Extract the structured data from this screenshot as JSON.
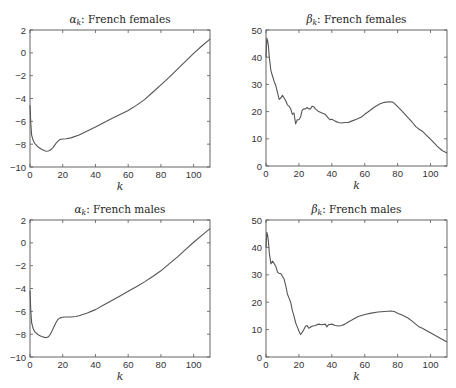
{
  "chart_data": [
    {
      "id": "alpha_females",
      "type": "line",
      "title": "α_k: French females",
      "title_symbol": "α",
      "title_subscript": "k",
      "title_text": ": French females",
      "xlabel": "k",
      "ylabel": "",
      "xlim": [
        0,
        110
      ],
      "ylim": [
        -10,
        2
      ],
      "xticks": [
        0,
        20,
        40,
        60,
        80,
        100
      ],
      "yticks": [
        -10,
        -8,
        -6,
        -4,
        -2,
        0,
        2
      ],
      "grid": false,
      "series": [
        {
          "name": "alpha_k",
          "x": [
            0,
            0.5,
            1,
            2,
            3,
            5,
            7,
            9,
            10,
            11,
            12,
            13,
            14,
            15,
            16,
            17,
            18,
            19,
            20,
            22,
            25,
            30,
            35,
            40,
            45,
            50,
            55,
            60,
            65,
            70,
            75,
            80,
            85,
            90,
            95,
            100,
            105,
            110
          ],
          "values": [
            -4.6,
            -6.2,
            -7.2,
            -7.7,
            -7.95,
            -8.25,
            -8.45,
            -8.58,
            -8.62,
            -8.6,
            -8.55,
            -8.45,
            -8.3,
            -8.1,
            -7.9,
            -7.75,
            -7.62,
            -7.57,
            -7.55,
            -7.52,
            -7.45,
            -7.2,
            -6.85,
            -6.5,
            -6.12,
            -5.75,
            -5.4,
            -5.05,
            -4.6,
            -4.1,
            -3.45,
            -2.8,
            -2.15,
            -1.45,
            -0.75,
            -0.05,
            0.6,
            1.2
          ]
        }
      ]
    },
    {
      "id": "beta_females",
      "type": "line",
      "title": "β_k: French females",
      "title_symbol": "β",
      "title_subscript": "k",
      "title_text": ": French females",
      "xlabel": "k",
      "ylabel": "",
      "xlim": [
        0,
        110
      ],
      "ylim": [
        0,
        50
      ],
      "xticks": [
        0,
        20,
        40,
        60,
        80,
        100
      ],
      "yticks": [
        0,
        10,
        20,
        30,
        40,
        50
      ],
      "grid": false,
      "series": [
        {
          "name": "beta_k",
          "x": [
            0,
            0.5,
            1,
            1.5,
            2,
            3,
            4,
            5,
            6,
            7,
            8,
            9,
            10,
            11,
            12,
            13,
            14,
            15,
            16,
            17,
            18,
            19,
            20,
            21,
            22,
            23,
            24,
            25,
            26,
            27,
            28,
            29,
            30,
            32,
            34,
            36,
            38,
            39,
            40,
            42,
            44,
            46,
            48,
            50,
            52,
            55,
            58,
            60,
            63,
            66,
            69,
            72,
            75,
            77,
            78,
            80,
            83,
            86,
            89,
            91,
            92,
            93,
            95,
            98,
            101,
            104,
            107,
            110
          ],
          "values": [
            40,
            47,
            46,
            44,
            40,
            35,
            33,
            31,
            29.5,
            27,
            24.5,
            25,
            26,
            25,
            24,
            22.5,
            22,
            21,
            19,
            19.5,
            15.5,
            17,
            17,
            18,
            20.5,
            21,
            21,
            21.5,
            21,
            21,
            22,
            21.8,
            21,
            20,
            19.5,
            19,
            17.5,
            17,
            17.2,
            16.5,
            16,
            15.8,
            16,
            16,
            16.5,
            17.2,
            18,
            19,
            20.3,
            21.7,
            22.8,
            23.4,
            23.6,
            23.5,
            23,
            21.8,
            20,
            18,
            16,
            14.5,
            14,
            13.5,
            12.8,
            11,
            9.2,
            7.3,
            5.7,
            4.8
          ]
        }
      ]
    },
    {
      "id": "alpha_males",
      "type": "line",
      "title": "α_k: French males",
      "title_symbol": "α",
      "title_subscript": "k",
      "title_text": ": French males",
      "xlabel": "k",
      "ylabel": "",
      "xlim": [
        0,
        110
      ],
      "ylim": [
        -10,
        2
      ],
      "xticks": [
        0,
        20,
        40,
        60,
        80,
        100
      ],
      "yticks": [
        -10,
        -8,
        -6,
        -4,
        -2,
        0,
        2
      ],
      "grid": false,
      "series": [
        {
          "name": "alpha_k",
          "x": [
            0,
            0.5,
            1,
            2,
            3,
            5,
            7,
            9,
            10,
            11,
            12,
            13,
            14,
            15,
            16,
            17,
            18,
            19,
            20,
            22,
            25,
            28,
            30,
            35,
            40,
            45,
            50,
            55,
            60,
            65,
            70,
            75,
            80,
            85,
            90,
            95,
            100,
            105,
            110
          ],
          "values": [
            -4.2,
            -6.0,
            -7.0,
            -7.55,
            -7.8,
            -8.05,
            -8.2,
            -8.28,
            -8.3,
            -8.25,
            -8.1,
            -7.85,
            -7.55,
            -7.25,
            -6.95,
            -6.72,
            -6.6,
            -6.55,
            -6.52,
            -6.5,
            -6.5,
            -6.45,
            -6.38,
            -6.15,
            -5.85,
            -5.45,
            -5.05,
            -4.65,
            -4.25,
            -3.85,
            -3.42,
            -2.95,
            -2.45,
            -1.85,
            -1.25,
            -0.6,
            0.05,
            0.65,
            1.25
          ]
        }
      ]
    },
    {
      "id": "beta_males",
      "type": "line",
      "title": "β_k: French males",
      "title_symbol": "β",
      "title_subscript": "k",
      "title_text": ": French males",
      "xlabel": "k",
      "ylabel": "",
      "xlim": [
        0,
        110
      ],
      "ylim": [
        0,
        50
      ],
      "xticks": [
        0,
        20,
        40,
        60,
        80,
        100
      ],
      "yticks": [
        0,
        10,
        20,
        30,
        40,
        50
      ],
      "grid": false,
      "series": [
        {
          "name": "beta_k",
          "x": [
            0,
            0.5,
            1,
            1.5,
            2,
            3,
            4,
            5,
            6,
            7,
            8,
            9,
            10,
            11,
            12,
            13,
            14,
            15,
            16,
            17,
            18,
            19,
            20,
            21,
            22,
            23,
            24,
            25,
            26,
            28,
            30,
            32,
            34,
            36,
            37,
            38,
            40,
            42,
            44,
            46,
            48,
            50,
            53,
            56,
            60,
            64,
            68,
            72,
            76,
            78,
            80,
            83,
            86,
            89,
            91,
            93,
            95,
            98,
            101,
            104,
            107,
            110
          ],
          "values": [
            40,
            45.5,
            44.5,
            42,
            38,
            34,
            35,
            34,
            33,
            31,
            30.5,
            30.5,
            29.5,
            28.5,
            26,
            23,
            21.5,
            20,
            17,
            15,
            12.5,
            11,
            9.5,
            8.2,
            9,
            10,
            11.2,
            11.5,
            10.5,
            11.2,
            11.5,
            12,
            11.8,
            12,
            11,
            11.8,
            12,
            11.5,
            11.3,
            11.5,
            12,
            12.8,
            13.8,
            14.8,
            15.5,
            16,
            16.4,
            16.6,
            16.8,
            16.6,
            16,
            15.2,
            14.3,
            13,
            12,
            11,
            10.5,
            9.5,
            8.5,
            7.5,
            6.5,
            5.5
          ]
        }
      ]
    }
  ]
}
